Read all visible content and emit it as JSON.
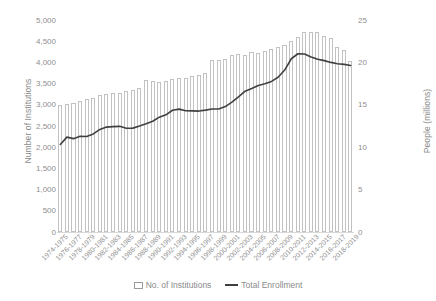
{
  "chart_data": {
    "type": "bar",
    "title": "",
    "xlabel": "",
    "ylabel": "Number of Institutions",
    "y2label": "People (millions)",
    "ylim": [
      0,
      5000
    ],
    "y2lim": [
      0,
      25
    ],
    "grid": false,
    "legend_position": "bottom",
    "y_ticks": [
      "5,000",
      "4,500",
      "4,000",
      "3,500",
      "3,000",
      "2,500",
      "2,000",
      "1,500",
      "1,000",
      "500",
      "0"
    ],
    "y_tick_values": [
      5000,
      4500,
      4000,
      3500,
      3000,
      2500,
      2000,
      1500,
      1000,
      500,
      0
    ],
    "y2_ticks": [
      "25",
      "20",
      "15",
      "10",
      "5",
      "0"
    ],
    "y2_tick_values": [
      25,
      20,
      15,
      10,
      5,
      0
    ],
    "categories": [
      "1974-1975",
      "1975-1976",
      "1976-1977",
      "1977-1978",
      "1978-1979",
      "1979-1980",
      "1980-1981",
      "1981-1982",
      "1982-1983",
      "1983-1984",
      "1984-1985",
      "1985-1986",
      "1986-1987",
      "1987-1988",
      "1988-1989",
      "1989-1990",
      "1990-1991",
      "1991-1992",
      "1992-1993",
      "1993-1994",
      "1994-1995",
      "1995-1996",
      "1996-1997",
      "1997-1998",
      "1998-1999",
      "1999-2000",
      "2000-2001",
      "2001-2002",
      "2002-2003",
      "2003-2004",
      "2004-2005",
      "2005-2006",
      "2006-2007",
      "2007-2008",
      "2008-2009",
      "2009-2010",
      "2010-2011",
      "2011-2012",
      "2012-2013",
      "2013-2014",
      "2014-2015",
      "2015-2016",
      "2016-2017",
      "2017-2018",
      "2018-2019"
    ],
    "x_tick_labels": [
      "1974-1975",
      "1976-1977",
      "1978-1979",
      "1980-1981",
      "1982-1983",
      "1984-1985",
      "1986-1987",
      "1988-1989",
      "1990-1991",
      "1992-1993",
      "1994-1995",
      "1996-1997",
      "1998-1999",
      "2000-2001",
      "2002-2003",
      "2004-2005",
      "2006-2007",
      "2008-2009",
      "2010-2011",
      "2012-2013",
      "2014-2015",
      "2016-2017",
      "2018-2019"
    ],
    "series": [
      {
        "name": "No. of Institutions",
        "type": "bar",
        "axis": "left",
        "color": "#ffffff",
        "edge_color": "#c2c2c2",
        "values": [
          3004,
          3026,
          3046,
          3095,
          3134,
          3152,
          3231,
          3253,
          3280,
          3284,
          3331,
          3340,
          3406,
          3587,
          3565,
          3535,
          3559,
          3601,
          3638,
          3632,
          3688,
          3706,
          3762,
          4064,
          4048,
          4084,
          4182,
          4197,
          4168,
          4236,
          4216,
          4276,
          4314,
          4352,
          4409,
          4495,
          4599,
          4706,
          4726,
          4724,
          4627,
          4583,
          4360,
          4298,
          4042
        ]
      },
      {
        "name": "Total Enrollment",
        "type": "line",
        "axis": "right",
        "color": "#404040",
        "values": [
          10.32,
          11.19,
          11.01,
          11.29,
          11.26,
          11.57,
          12.1,
          12.37,
          12.43,
          12.46,
          12.24,
          12.25,
          12.5,
          12.77,
          13.06,
          13.54,
          13.82,
          14.36,
          14.49,
          14.3,
          14.28,
          14.26,
          14.37,
          14.5,
          14.51,
          14.79,
          15.31,
          15.93,
          16.61,
          16.91,
          17.27,
          17.49,
          17.76,
          18.25,
          19.1,
          20.43,
          21.02,
          20.99,
          20.64,
          20.38,
          20.21,
          20.0,
          19.84,
          19.77,
          19.64
        ]
      }
    ],
    "legend": [
      {
        "label": "No. of Institutions",
        "marker": "box"
      },
      {
        "label": "Total Enrollment",
        "marker": "line"
      }
    ]
  }
}
